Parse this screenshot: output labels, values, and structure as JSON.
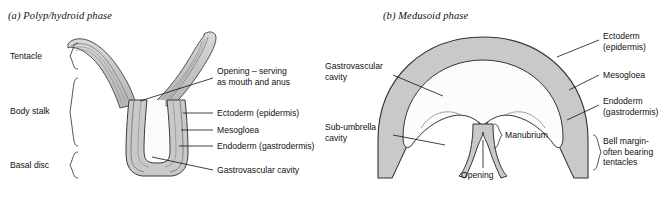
{
  "figure": {
    "panels": [
      {
        "id": "polyp",
        "title": "(a) Polyp/hydroid phase",
        "bracket_labels": [
          {
            "name": "tentacle",
            "text": "Tentacle"
          },
          {
            "name": "body-stalk",
            "text": "Body stalk"
          },
          {
            "name": "basal-disc",
            "text": "Basal disc"
          }
        ],
        "leader_labels": [
          {
            "name": "opening-mouth-anus",
            "line1": "Opening – serving",
            "line2": "as mouth and anus"
          },
          {
            "name": "ectoderm",
            "line1": "Ectoderm (epidermis)",
            "line2": ""
          },
          {
            "name": "mesogloea",
            "line1": "Mesogloea",
            "line2": ""
          },
          {
            "name": "endoderm",
            "line1": "Endoderm (gastrodermis)",
            "line2": ""
          },
          {
            "name": "gastrovascular-cavity",
            "line1": "Gastrovascular cavity",
            "line2": ""
          }
        ]
      },
      {
        "id": "medusa",
        "title": "(b) Medusoid phase",
        "left_labels": [
          {
            "name": "gastrovascular-cavity",
            "line1": "Gastrovascular",
            "line2": "cavity"
          },
          {
            "name": "sub-umbrella-cavity",
            "line1": "Sub-umbrella",
            "line2": "cavity"
          }
        ],
        "right_labels": [
          {
            "name": "ectoderm",
            "line1": "Ectoderm",
            "line2": "(epidermis)",
            "line3": ""
          },
          {
            "name": "mesogloea",
            "line1": "Mesogloea",
            "line2": "",
            "line3": ""
          },
          {
            "name": "endoderm",
            "line1": "Endoderm",
            "line2": "(gastrodermis)",
            "line3": ""
          },
          {
            "name": "bell-margin",
            "line1": "Bell margin-",
            "line2": "often bearing",
            "line3": "tentacles"
          }
        ],
        "center_labels": [
          {
            "name": "opening",
            "text": "Opening"
          },
          {
            "name": "manubrium",
            "text": "Manubrium"
          }
        ]
      }
    ]
  },
  "colors": {
    "tissue_fill": "#c9c9c9",
    "tissue_fill_light": "#d6d6d6",
    "outline": "#3a3a3a",
    "outline_dark": "#222222",
    "leader_line": "#111111",
    "background": "#ffffff",
    "text": "#111111"
  }
}
